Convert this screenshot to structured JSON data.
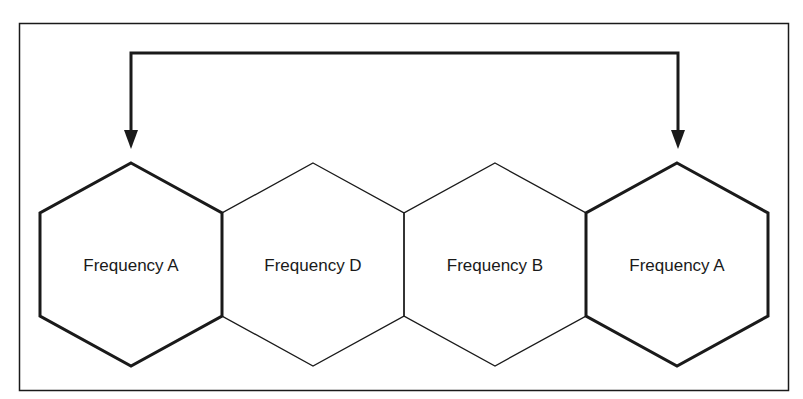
{
  "diagram": {
    "cells": [
      {
        "label": "Frequency A",
        "emphasized": true
      },
      {
        "label": "Frequency D",
        "emphasized": false
      },
      {
        "label": "Frequency B",
        "emphasized": false
      },
      {
        "label": "Frequency A",
        "emphasized": true
      }
    ],
    "connector": {
      "from": 0,
      "to": 3,
      "style": "double-arrow"
    },
    "colors": {
      "stroke": "#1a1a1a",
      "background": "#ffffff"
    }
  }
}
